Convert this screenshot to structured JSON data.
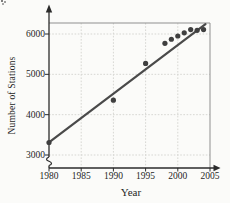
{
  "chart_data": {
    "type": "scatter",
    "title": "",
    "xlabel": "Year",
    "ylabel": "Number of Stations",
    "x_ticks": [
      1980,
      1985,
      1990,
      1995,
      2000,
      2005
    ],
    "y_ticks": [
      6000,
      5000,
      4000,
      3000
    ],
    "xlim": [
      1980,
      2005
    ],
    "ylim": [
      3000,
      6300
    ],
    "y_axis_break": true,
    "grid": true,
    "legend": false,
    "points": [
      {
        "year": 1980,
        "stations": 3310
      },
      {
        "year": 1990,
        "stations": 4360
      },
      {
        "year": 1995,
        "stations": 5270
      },
      {
        "year": 1998,
        "stations": 5770
      },
      {
        "year": 1999,
        "stations": 5870
      },
      {
        "year": 2000,
        "stations": 5950
      },
      {
        "year": 2001,
        "stations": 6030
      },
      {
        "year": 2002,
        "stations": 6110
      },
      {
        "year": 2003,
        "stations": 6090
      },
      {
        "year": 2004,
        "stations": 6110
      }
    ],
    "trend_line": {
      "x1": 1980,
      "y1": 3310,
      "x2": 2004.3,
      "y2": 6245
    },
    "colors": {
      "point": "#3f3f3f",
      "line": "#4a4a4a",
      "axis": "#2b2b2b",
      "frame": "#8f8f8f",
      "grid": "#d7d7d3",
      "text": "#1f1f1f",
      "background": "#fbfbf9"
    }
  }
}
